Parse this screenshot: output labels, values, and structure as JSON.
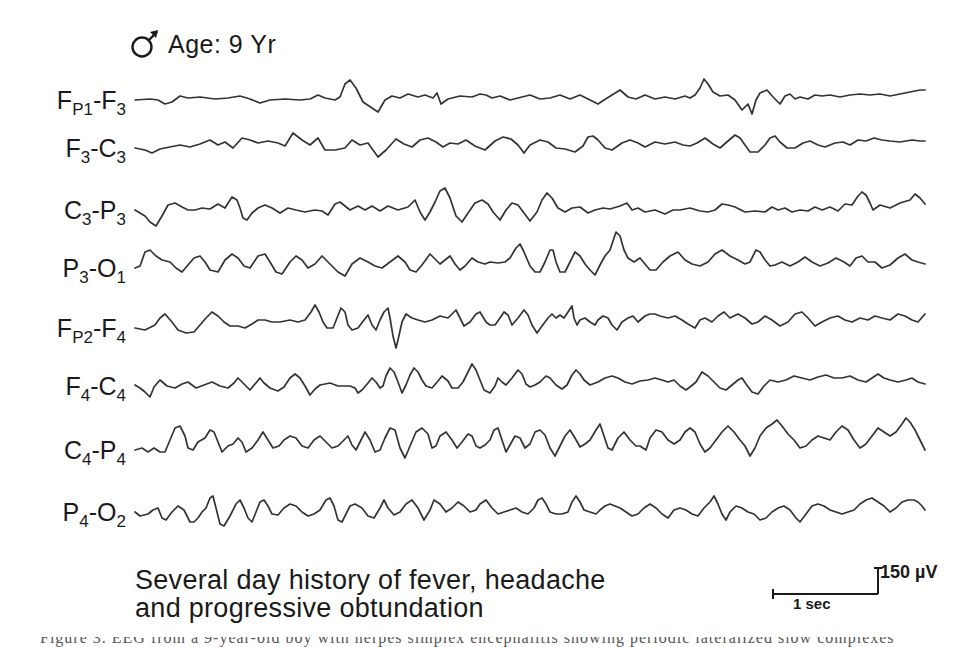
{
  "header": {
    "sex_icon": "male-symbol-icon",
    "age_label": "Age: 9 Yr"
  },
  "channels": [
    {
      "id": "fp1-f3",
      "main": "F",
      "sub1": "P1",
      "sep": "-",
      "main2": "F",
      "sub2": "3",
      "label_y": 88
    },
    {
      "id": "f3-c3",
      "main": "F",
      "sub1": "3",
      "sep": "-",
      "main2": "C",
      "sub2": "3",
      "label_y": 136
    },
    {
      "id": "c3-p3",
      "main": "C",
      "sub1": "3",
      "sep": "-",
      "main2": "P",
      "sub2": "3",
      "label_y": 198
    },
    {
      "id": "p3-o1",
      "main": "P",
      "sub1": "3",
      "sep": "-",
      "main2": "O",
      "sub2": "1",
      "label_y": 256
    },
    {
      "id": "fp2-f4",
      "main": "F",
      "sub1": "P2",
      "sep": "-",
      "main2": "F",
      "sub2": "4",
      "label_y": 316
    },
    {
      "id": "f4-c4",
      "main": "F",
      "sub1": "4",
      "sep": "-",
      "main2": "C",
      "sub2": "4",
      "label_y": 374
    },
    {
      "id": "c4-p4",
      "main": "C",
      "sub1": "4",
      "sep": "-",
      "main2": "P",
      "sub2": "4",
      "label_y": 438
    },
    {
      "id": "p4-o2",
      "main": "P",
      "sub1": "4",
      "sep": "-",
      "main2": "O",
      "sub2": "2",
      "label_y": 500
    }
  ],
  "traces": [
    "135,100 150,99 158,100 165,104 172,102 180,96 188,98 200,97 215,99 228,98 240,96 250,99 260,103 270,100 285,99 300,100 310,99 318,95 325,98 335,100 340,97 345,84 350,80 356,88 363,102 372,108 378,112 385,100 392,96 400,98 408,94 418,97 425,95 433,98 437,93 441,104 448,99 460,96 472,97 480,94 486,95 492,98 500,96 510,100 522,97 530,95 540,99 550,98 560,95 570,99 580,95 590,100 598,104 604,100 612,95 620,90 628,97 636,99 645,95 655,99 665,97 675,99 685,96 690,98 695,95 700,88 704,79 708,84 713,92 720,96 728,95 735,100 742,110 748,104 752,114 756,100 760,93 767,90 774,98 780,104 785,96 790,94 795,99 800,97 808,99 815,95 822,96 830,95 840,97 850,95 860,94 870,95 880,94 890,96 900,94 910,92 920,90 925,90",
    "135,148 145,150 152,153 160,149 170,147 180,145 190,147 200,144 210,140 218,145 225,142 233,148 242,138 250,140 258,143 268,141 278,143 285,146 293,133 302,140 310,145 318,138 325,150 335,150 345,148 352,140 360,145 368,143 378,157 386,150 396,139 404,144 412,147 420,140 428,138 436,142 443,147 450,143 458,144 466,140 475,146 485,150 495,141 503,137 511,139 518,145 524,153 530,145 540,140 548,142 556,148 565,149 575,152 583,146 588,137 593,136 598,140 605,148 612,150 622,143 630,140 638,143 645,147 655,142 665,144 675,142 683,145 690,146 697,143 705,138 713,144 720,148 728,141 735,135 740,138 745,145 750,152 758,152 765,145 770,138 775,136 780,142 787,148 795,148 803,143 810,141 818,145 825,147 835,143 843,142 850,145 858,140 866,141 874,138 882,140 890,141 900,142 912,140 920,141 925,141",
    "135,210 140,213 145,216 150,222 156,226 162,216 168,205 175,203 182,207 188,210 195,210 202,208 210,209 218,204 225,208 232,197 237,200 240,208 243,218 247,220 252,213 258,208 265,205 272,208 280,213 288,208 296,210 305,212 315,210 322,211 328,215 335,204 340,202 345,206 350,210 358,206 365,210 372,206 380,211 388,206 398,210 408,207 415,200 420,212 425,220 430,212 435,202 440,191 445,188 450,198 456,216 462,222 468,213 475,203 482,200 488,204 493,212 500,220 506,210 512,203 518,205 524,213 530,221 537,212 542,200 547,193 552,198 558,208 565,212 572,208 580,207 588,213 595,210 603,208 610,209 620,206 627,203 632,210 638,208 645,212 655,210 665,214 673,210 680,210 690,208 700,211 708,212 715,210 722,204 728,205 735,207 745,212 755,211 765,212 772,207 778,210 785,208 792,212 800,210 808,211 815,207 822,210 830,207 838,211 845,204 852,205 858,196 862,192 866,195 870,203 873,210",
    "135,268 140,266 145,252 150,250 156,256 162,260 170,262 176,268 182,272 188,265 194,258 200,256 205,262 210,270 218,272 225,260 232,254 238,258 244,266 250,268 258,256 265,254 270,262 276,272 282,274 290,262 296,256 302,260 308,268 315,264 322,256 330,264 338,272 345,276 352,264 360,258 368,262 375,266 382,268 390,262 398,256 405,262 410,270 416,272 422,265 430,254 436,260 440,264 445,260 450,256 455,264 460,270 465,266 472,258 478,262 485,264 490,262 498,263 505,262 510,258 516,248 520,244 524,252 530,266 535,272 540,272 545,262 550,250 553,250 556,262 560,272 565,272 570,262 575,252 580,256 585,264 590,270 595,275 600,265 605,256 610,250 616,232 620,236 624,250 628,258 634,262 640,258 645,264 650,270 656,270 663,262 670,256 678,252 685,260 692,264 700,266 708,262 715,254 722,250 730,256 738,260 745,264 750,262 756,250 760,252 765,260 770,266 775,265",
    "135,328 145,330 155,325 160,318 165,314 172,322 178,330 186,333 194,332 200,325 206,318 212,312 218,316 224,322 230,326 238,326 245,328 252,324 258,320 265,320 272,322 280,322 290,320 298,322 305,320 311,312 315,305 319,312 323,322 327,328 333,328 337,318 341,308 345,312 348,325 352,330 358,328 364,320 368,315 372,325 376,330 380,320 384,312 388,308 390,318 393,336 396,348 398,340 402,322 406,314 412,318 418,320 425,322 432,320 440,316 448,318 452,314 456,310 460,318 464,326 470,322 476,314 480,312 486,322 490,325 495,325 500,318 504,312 508,315 512,325 518,318 524,310 528,315 532,325 537,333 542,326 548,318 552,314 556,318 560,315 564,318 568,312 572,306 574,318 577,325 580,320 585,318 590,322 595,325 598,320 603,316 608,318 612,325 617,330 622,322 628,318 633,316 638,322 645,316 650,314 655,314 660,316 668,318 675,316 682,320 688,324 695,328 700,320 705,318 712,322 718,316 724,312 730,318 738,314",
    "135,385 140,388 145,392 150,397 154,387 160,380 167,386 175,388 182,384 188,382 196,388 204,385 212,382 220,386 228,388 234,383 238,378 244,384 250,390 255,384 260,378 264,383 270,388 278,391 284,387 290,378 295,374 300,378 305,386 310,395 315,389 320,385 330,383 338,386 345,386 350,386 355,388 358,393 362,390 368,383 372,378 376,382 380,388 383,386 386,376 390,368 394,372 398,382 402,393 406,385 410,375 414,368 418,372 422,380 426,386 432,388 438,381 442,376 448,381 452,388 458,388 463,382 468,372 472,364 476,370 480,380 484,390 490,393 495,386 498,378 502,382 506,385 512,378 518,370 522,374 526,384 530,387 535,385 540,382 546,376 550,378 556,385 562,389 567,385 572,375 576,370 580,374 584,380 590,385 598,382 605,378 612,376 618,378 625,382 632,384 640,381 648,380 655,378 662,380 668,382 674,380 680,386 686,390 690,387",
    "135,450 142,448 148,452 154,448 160,452 165,452 170,440 175,428 180,426 185,436 188,448 193,450 198,442 205,438 210,430 214,432 218,442 222,452 228,446 233,444 238,438 242,442 246,452 252,448 258,440 263,432 268,440 273,448 279,446 284,440 290,436 296,438 302,446 308,448 314,440 320,436 326,442 332,448 338,446 344,440 348,436 352,445 356,450 360,442 365,432 370,440 375,452 380,450 385,438 390,428 395,430 400,448 405,458 410,446 416,432 422,428 428,434 432,448 436,446 440,436 446,432 452,440 457,448 462,442 468,434 472,436 476,446 480,448 485,445 490,440 494,430 498,428 502,440 506,452 510,445 515,436 520,438 525,448 530,444 535,432 540,430 545,435 550,448 555,456 560,446 565,436 570,430 575,438 580,447 585,444 590,440 596,430 600,424 604,436 608,448 612,450 618,438 624,432 630,440 636,446 640,446 646,450 650,438 656,430 662,432 668,440 674,444 680,440 685,432 690,428",
    "135,512 140,516 148,514 153,510 158,508 162,518 166,520 172,512 178,506 184,510 190,522 194,522 198,518 202,512 206,508 210,498 213,496 216,508 220,524 224,526 230,516 236,504 240,500 244,508 248,518 252,522 256,512 260,502 264,500 268,506 272,514 278,515 284,508 290,504 296,506 302,512 308,516 314,514 320,510 326,500 330,498 334,506 338,520 342,522 346,514 350,506 355,504 362,508 368,516 374,518 380,508 384,500 388,508 394,515 400,512 406,504 412,500 418,508 424,520 430,510 434,500 440,504 446,512 452,508 458,502 464,506 470,512 476,510 480,504 486,500 492,508 498,514 504,512 510,510 516,508 522,512 528,514 534,508 538,500 542,498 546,504 550,512 556,514 562,514 568,512 572,502 576,496 580,502 584,510 590,512 596,514 600,510 605,506 610,504 615,506 620,508"
  ],
  "trace_x_offset_continuations": [
    "690,98 700,88",
    "690,146",
    "873,210",
    "775,265",
    "738,314",
    "690,387",
    "690,428",
    "620,508"
  ],
  "traces_tail": [
    "925,90",
    "925,141",
    "873,210 880,205 890,208 900,203 910,200 915,194 920,198 925,204",
    "775,265 782,262 790,266 798,262 805,257 812,262 820,266 828,263 836,258 844,262 850,266 856,258 862,256 868,262 875,262 882,268 890,265 898,258 905,254 912,260 918,262 925,264",
    "738,314 745,318 752,324 758,322 765,316 772,320 780,326 788,322 795,314 802,312 808,318 815,326 822,322 830,318 838,316 845,320 852,322 860,318 868,320 875,316 882,318 890,320 898,314 905,316 912,320 918,322 925,314",
    "690,387 696,382 702,372 708,376 714,382 720,388 726,390 732,385 738,380 742,378 746,384 752,392 758,394 764,386 770,380 778,382 786,380 794,376 802,378 810,380 818,377 826,375 834,378 842,378 850,376 858,380 866,382 872,378 878,374 884,378 890,380 898,382 906,380 912,378 918,382 925,384",
    "690,428 695,432 700,444 705,452 710,448 716,440 722,432 728,426 734,432 740,440 745,446 750,456 755,448 760,436 766,428 772,424 777,420 782,426 788,434 794,440 800,448 806,446 812,440 818,436 824,438 830,440 836,432 842,426 848,430 854,440 860,448 866,444 872,436 878,428 884,432 890,436 896,432 902,424 906,418 910,422 915,430 920,440 925,450",
    "620,508 626,512 632,516 638,514 644,508 650,504 656,508 662,514 668,518 674,510 680,508 686,510 692,514 698,516 704,508 710,502 714,496 718,504 722,514 726,520 730,512 736,506 742,508 748,512 754,514 760,520 766,518 772,512 778,508 784,506 790,510 796,518 800,522 806,514 812,506 818,504 824,506 830,510 836,512 842,514 848,512 854,510 860,504 866,500 872,498 878,502 884,506 890,512 896,508 902,502 908,500 914,500 918,502 922,506 925,510"
  ],
  "caption": {
    "line1": "Several day history of fever, headache",
    "line2": "and progressive obtundation"
  },
  "scale_bar": {
    "amplitude_label": "150 µV",
    "time_label": "1 sec"
  },
  "footer_cutoff_text": "Figure 3. EEG from a 9-year-old boy with herpes simplex encephalitis showing periodic lateralized slow complexes"
}
